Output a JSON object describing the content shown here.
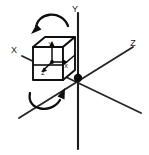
{
  "figure": {
    "background_color": "#ffffff",
    "stroke_color": "#111111",
    "line_color": "#2a2a2a"
  },
  "world_axes": {
    "x": {
      "label": "X",
      "label_x": 14,
      "label_y": 51
    },
    "y": {
      "label": "Y",
      "label_x": 75,
      "label_y": 10
    },
    "z": {
      "label": "Z",
      "label_x": 133,
      "label_y": 44
    }
  },
  "origin": {
    "name": "origin-point",
    "x": 78,
    "y": 78,
    "radius": 4.2
  },
  "cube": {
    "name": "rotating-cube",
    "center_x": 52,
    "center_y": 59,
    "local_axes": {
      "x": {
        "label": "X",
        "label_x": 66,
        "label_y": 66
      },
      "y": {
        "label": "Y",
        "label_x": 50,
        "label_y": 45
      },
      "z": {
        "label": "Z",
        "label_x": 43,
        "label_y": 73
      }
    }
  },
  "rotation_arrows": [
    {
      "name": "top-rotation-arrow",
      "direction": "counterclockwise",
      "position": "above-cube"
    },
    {
      "name": "bottom-rotation-arrow",
      "direction": "clockwise",
      "position": "below-cube"
    }
  ]
}
